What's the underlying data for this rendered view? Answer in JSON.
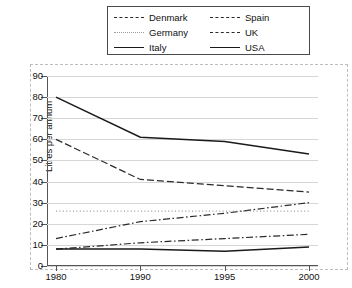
{
  "chart_data": {
    "type": "line",
    "title": "",
    "xlabel": "",
    "ylabel": "Litres per annum",
    "x": [
      "1980",
      "1990",
      "1995",
      "2000"
    ],
    "categories": [
      "1980",
      "1990",
      "1995",
      "2000"
    ],
    "ylim": [
      0,
      90
    ],
    "ytick_step": 10,
    "yticks": [
      "0",
      "10",
      "20",
      "30",
      "40",
      "50",
      "60",
      "70",
      "80",
      "90"
    ],
    "grid": true,
    "legend_position": "top",
    "series": [
      {
        "name": "Denmark",
        "style": "dash-dot",
        "color": "#2a2a2a",
        "values": [
          13,
          21,
          25,
          30
        ]
      },
      {
        "name": "Germany",
        "style": "dotted",
        "color": "#9a9a9a",
        "values": [
          26,
          26,
          26,
          26
        ]
      },
      {
        "name": "Italy",
        "style": "solid",
        "color": "#1a1a1a",
        "values": [
          80,
          61,
          59,
          53
        ]
      },
      {
        "name": "Spain",
        "style": "dashed",
        "color": "#2a2a2a",
        "values": [
          60,
          41,
          38,
          35
        ]
      },
      {
        "name": "UK",
        "style": "dash-dot",
        "color": "#2a2a2a",
        "values": [
          8,
          11,
          13,
          15
        ]
      },
      {
        "name": "USA",
        "style": "solid",
        "color": "#1a1a1a",
        "values": [
          8,
          8,
          7,
          9
        ]
      }
    ]
  },
  "legend": {
    "items": [
      {
        "label": "Denmark",
        "style": "dash-dot"
      },
      {
        "label": "Spain",
        "style": "dashed"
      },
      {
        "label": "Germany",
        "style": "dotted"
      },
      {
        "label": "UK",
        "style": "dash-dot"
      },
      {
        "label": "Italy",
        "style": "solid"
      },
      {
        "label": "USA",
        "style": "solid"
      }
    ]
  },
  "axes": {
    "y_title": "Litres per annum",
    "y_labels": [
      "90",
      "80",
      "70",
      "60",
      "50",
      "40",
      "30",
      "20",
      "10",
      "0"
    ],
    "x_labels": [
      "1980",
      "1990",
      "1995",
      "2000"
    ]
  }
}
